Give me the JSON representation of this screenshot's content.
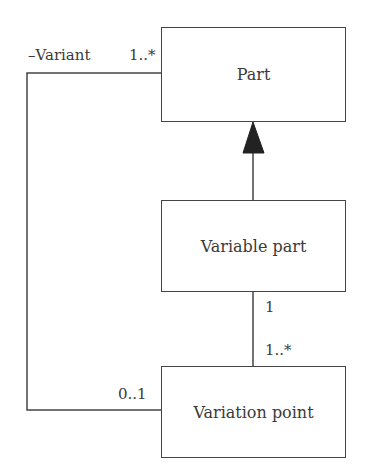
{
  "diagram": {
    "type": "UML class diagram",
    "classes": [
      {
        "id": "part",
        "name": "Part"
      },
      {
        "id": "variable_part",
        "name": "Variable part"
      },
      {
        "id": "variation_point",
        "name": "Variation point"
      }
    ],
    "relations": [
      {
        "type": "generalization",
        "from": "Variable part",
        "to": "Part"
      },
      {
        "type": "association",
        "from": "Variable part",
        "to": "Variation point",
        "from_multiplicity": "1",
        "to_multiplicity": "1..*"
      },
      {
        "type": "association",
        "from": "Variation point",
        "to": "Part",
        "role": "–Variant",
        "from_multiplicity": "0..1",
        "to_multiplicity": "1..*"
      }
    ],
    "labels": {
      "variant_role": "–Variant",
      "variant_mult": "1..*",
      "vp_mult_left": "0..1",
      "vpart_mult": "1",
      "vpoint_mult": "1..*"
    }
  }
}
